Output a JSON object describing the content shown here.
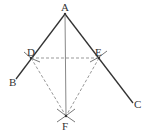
{
  "diagram": {
    "type": "geometric-construction",
    "points": {
      "A": {
        "label": "A",
        "x": 65,
        "y": 14
      },
      "B": {
        "label": "B",
        "x": 16,
        "y": 79
      },
      "C": {
        "label": "C",
        "x": 133,
        "y": 103
      },
      "D": {
        "label": "D",
        "x": 31,
        "y": 58
      },
      "E": {
        "label": "E",
        "x": 99,
        "y": 58
      },
      "F": {
        "label": "F",
        "x": 66,
        "y": 116
      }
    },
    "solid_lines": [
      [
        "A",
        "B"
      ],
      [
        "A",
        "C"
      ],
      [
        "A",
        "F"
      ]
    ],
    "dashed_lines": [
      [
        "D",
        "E"
      ],
      [
        "D",
        "F"
      ],
      [
        "E",
        "F"
      ]
    ],
    "colors": {
      "solid": "#333333",
      "bisector": "#888888",
      "dashed": "#999999"
    }
  }
}
